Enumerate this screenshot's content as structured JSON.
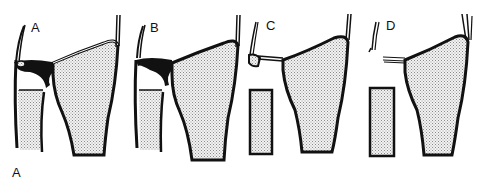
{
  "figure": {
    "label": "A",
    "panels": [
      {
        "id": "A",
        "label": "A",
        "state": "intact ligament complex"
      },
      {
        "id": "B",
        "label": "B",
        "state": "partial disruption"
      },
      {
        "id": "C",
        "label": "C",
        "state": "styloid avulsion"
      },
      {
        "id": "D",
        "label": "D",
        "state": "complete rupture"
      }
    ]
  },
  "colors": {
    "stroke": "#111111",
    "fill_stipple": "#d6d6d6",
    "background": "#ffffff"
  }
}
